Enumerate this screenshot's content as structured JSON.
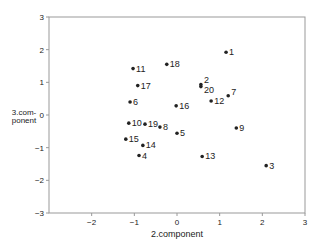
{
  "chart_data": {
    "type": "scatter",
    "title": "",
    "xlabel": "2.component",
    "ylabel": [
      "3.com-",
      "ponent"
    ],
    "xlim": [
      -3,
      3
    ],
    "ylim": [
      -3,
      3
    ],
    "xticks": [
      -2,
      -1,
      0,
      1,
      2,
      3
    ],
    "yticks": [
      -3,
      -2,
      -1,
      0,
      1,
      2,
      3
    ],
    "grid": false,
    "legend": null,
    "points": [
      {
        "label": "1",
        "x": 1.15,
        "y": 1.92
      },
      {
        "label": "2",
        "x": 0.56,
        "y": 0.93
      },
      {
        "label": "3",
        "x": 2.09,
        "y": -1.55
      },
      {
        "label": "4",
        "x": -0.89,
        "y": -1.24
      },
      {
        "label": "5",
        "x": 0.0,
        "y": -0.56
      },
      {
        "label": "6",
        "x": -1.1,
        "y": 0.4
      },
      {
        "label": "7",
        "x": 1.2,
        "y": 0.59
      },
      {
        "label": "8",
        "x": -0.4,
        "y": -0.37
      },
      {
        "label": "9",
        "x": 1.39,
        "y": -0.4
      },
      {
        "label": "10",
        "x": -1.13,
        "y": -0.25
      },
      {
        "label": "11",
        "x": -1.03,
        "y": 1.42
      },
      {
        "label": "12",
        "x": 0.8,
        "y": 0.43
      },
      {
        "label": "13",
        "x": 0.59,
        "y": -1.27
      },
      {
        "label": "14",
        "x": -0.8,
        "y": -0.93
      },
      {
        "label": "15",
        "x": -1.2,
        "y": -0.74
      },
      {
        "label": "16",
        "x": -0.02,
        "y": 0.28
      },
      {
        "label": "17",
        "x": -0.92,
        "y": 0.9
      },
      {
        "label": "18",
        "x": -0.24,
        "y": 1.55
      },
      {
        "label": "19",
        "x": -0.75,
        "y": -0.28
      },
      {
        "label": "20",
        "x": 0.56,
        "y": 0.87
      }
    ],
    "label_offsets": {
      "2": {
        "dx": 3,
        "dy": -2
      },
      "20": {
        "dx": 3,
        "dy": 6
      },
      "7": {
        "dx": 3,
        "dy": -1
      },
      "19": {
        "dx": 3,
        "dy": 3
      }
    },
    "colors": {
      "axis": "#999999",
      "point": "#222222",
      "text": "#222222"
    }
  }
}
